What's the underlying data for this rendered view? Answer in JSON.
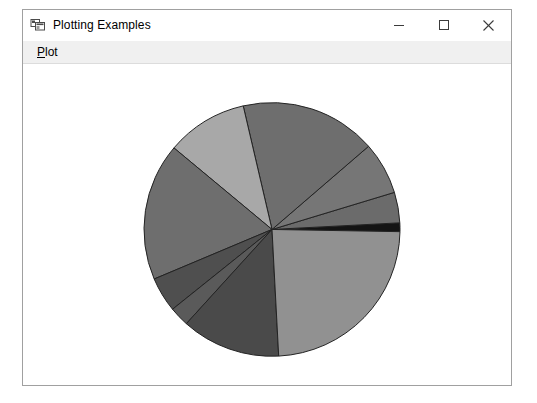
{
  "window": {
    "title": "Plotting Examples",
    "icon": "application-window-icon",
    "controls": {
      "minimize": "minimize-icon",
      "maximize": "maximize-icon",
      "close": "close-icon"
    }
  },
  "menubar": {
    "items": [
      {
        "label": "Plot",
        "accelerator": "P"
      }
    ]
  },
  "chart_data": {
    "type": "pie",
    "title": "",
    "xlabel": "",
    "ylabel": "",
    "grid": false,
    "legend": false,
    "legend_position": "none",
    "center": {
      "x": 272,
      "y": 230
    },
    "radius": 128,
    "start_angle_deg": -1,
    "direction": "counterclockwise",
    "edge_color": "#222222",
    "edge_width": 1,
    "categories": [
      "Slice 1",
      "Slice 2",
      "Slice 3",
      "Slice 4",
      "Slice 5",
      "Slice 6",
      "Slice 7",
      "Slice 8",
      "Slice 9",
      "Slice 10"
    ],
    "values": [
      4,
      14,
      24,
      62,
      37,
      63,
      16,
      9,
      45,
      86
    ],
    "percentages": [
      1.1,
      3.9,
      6.7,
      17.2,
      10.3,
      17.5,
      4.4,
      2.5,
      12.5,
      23.9
    ],
    "angles_deg": [
      4,
      14,
      24,
      62,
      37,
      63,
      16,
      9,
      45,
      86
    ],
    "colors": [
      "#141414",
      "#6b6b6b",
      "#767676",
      "#6e6e6e",
      "#a8a8a8",
      "#6e6e6e",
      "#4f4f4f",
      "#5a5a5a",
      "#4a4a4a",
      "#919191"
    ]
  }
}
